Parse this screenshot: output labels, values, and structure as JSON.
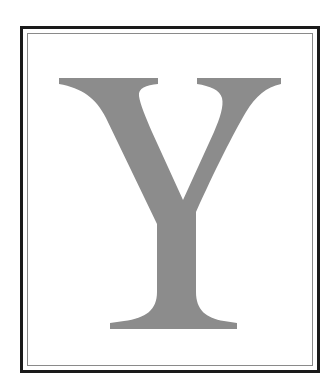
{
  "image": {
    "letter": "Y",
    "letter_color": "#8c8c8c",
    "background_color": "#ffffff",
    "frame": {
      "outer_border_color": "#1a1a1a",
      "inner_border_color": "#8a8a8a",
      "style": "double-line"
    }
  }
}
